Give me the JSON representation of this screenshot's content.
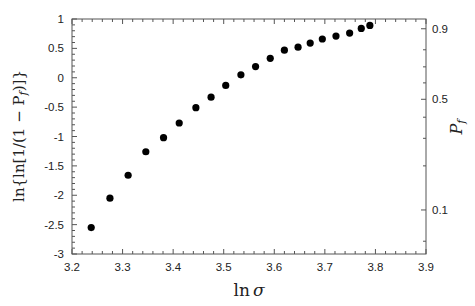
{
  "chart_data": {
    "type": "scatter",
    "title": "",
    "xlabel": "ln σ",
    "ylabel": "ln{ln[1/(1 − P_f)]}",
    "y2label": "P_f",
    "xlim": [
      3.2,
      3.9
    ],
    "ylim": [
      -3,
      1
    ],
    "grid": false,
    "legend": null,
    "x_ticks": [
      "3.2",
      "3.3",
      "3.4",
      "3.5",
      "3.6",
      "3.7",
      "3.8",
      "3.9"
    ],
    "y_ticks": [
      "1",
      "0.5",
      "0",
      "-0.5",
      "-1",
      "-1.5",
      "-2",
      "-2.5",
      "-3"
    ],
    "y2_ticks": [
      "0.9",
      "0.5",
      "0.1"
    ],
    "y2_scale": "weibull probability: y = ln(-ln(1-P_f))",
    "series": [
      {
        "name": "data",
        "marker": "filled-circle",
        "color": "#000000",
        "x": [
          3.238,
          3.275,
          3.311,
          3.346,
          3.381,
          3.412,
          3.445,
          3.475,
          3.504,
          3.534,
          3.563,
          3.592,
          3.62,
          3.647,
          3.671,
          3.695,
          3.722,
          3.749,
          3.772,
          3.789
        ],
        "y": [
          -2.55,
          -2.05,
          -1.66,
          -1.26,
          -1.02,
          -0.77,
          -0.51,
          -0.33,
          -0.13,
          0.05,
          0.19,
          0.33,
          0.47,
          0.52,
          0.59,
          0.66,
          0.71,
          0.76,
          0.84,
          0.89
        ]
      }
    ]
  },
  "labels": {
    "xlabel_ln": "ln",
    "xlabel_sigma": "σ",
    "ylabel_text": "ln{ln[1/(1 − P",
    "ylabel_sub": "f",
    "ylabel_tail": ")]}",
    "y2label_P": "P",
    "y2label_sub": "f"
  }
}
